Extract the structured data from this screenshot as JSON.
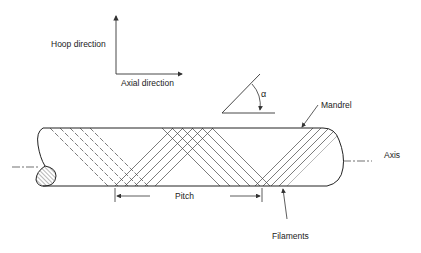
{
  "figure": {
    "type": "filament-winding-schematic",
    "labels": {
      "hoop_direction": "Hoop direction",
      "axial_direction": "Axial direction",
      "angle_symbol": "α",
      "mandrel": "Mandrel",
      "axis": "Axis",
      "pitch": "Pitch",
      "filaments": "Filaments"
    },
    "colors": {
      "line": "#333333",
      "background": "#ffffff"
    }
  }
}
